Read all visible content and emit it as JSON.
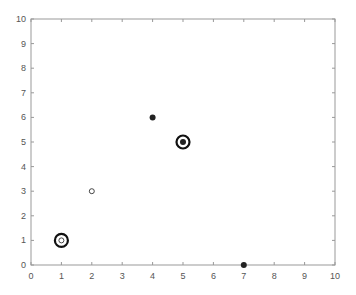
{
  "chart_data": {
    "type": "scatter",
    "title": "",
    "xlabel": "",
    "ylabel": "",
    "xlim": [
      0,
      10
    ],
    "ylim": [
      0,
      10
    ],
    "grid": false,
    "x_ticks": [
      "0",
      "1",
      "2",
      "3",
      "4",
      "5",
      "6",
      "7",
      "8",
      "9",
      "10"
    ],
    "y_ticks": [
      "0",
      "1",
      "2",
      "3",
      "4",
      "5",
      "6",
      "7",
      "8",
      "9",
      "10"
    ],
    "series": [
      {
        "name": "filled points",
        "marker": "filled-circle",
        "color": "#222222",
        "points": [
          {
            "x": 4,
            "y": 6
          },
          {
            "x": 5,
            "y": 5
          },
          {
            "x": 7,
            "y": 0
          }
        ]
      },
      {
        "name": "hollow points",
        "marker": "open-circle",
        "color": "#333333",
        "points": [
          {
            "x": 2,
            "y": 3
          },
          {
            "x": 1,
            "y": 1
          }
        ]
      },
      {
        "name": "highlighted",
        "marker": "large-ring",
        "color": "#111111",
        "points": [
          {
            "x": 1,
            "y": 1
          },
          {
            "x": 5,
            "y": 5
          }
        ]
      }
    ]
  },
  "colors": {
    "axis": "#999999",
    "tick_text": "#555555",
    "marker": "#222222"
  }
}
